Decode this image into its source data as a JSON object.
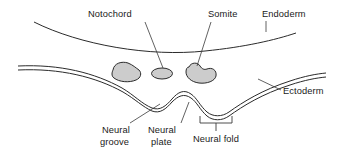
{
  "figure": {
    "background_color": "#ffffff",
    "line_color": "#2b2b2b",
    "leader_color": "#3a3a3a",
    "text_color": "#1a1a1a",
    "blob_fill_color": "#cccccc"
  },
  "labels": {
    "notochord": "Notochord",
    "somite": "Somite",
    "endoderm": "Endoderm",
    "ectoderm": "Ectoderm",
    "neural_groove_line1": "Neural",
    "neural_groove_line2": "groove",
    "neural_plate_line1": "Neural",
    "neural_plate_line2": "plate",
    "neural_fold": "Neural fold"
  },
  "structures": [
    {
      "name": "endoderm",
      "kind": "single-curve"
    },
    {
      "name": "ectoderm",
      "kind": "double-curve"
    },
    {
      "name": "notochord",
      "kind": "ellipse-blob",
      "fill": "#cccccc"
    },
    {
      "name": "somite-left",
      "kind": "bean-blob",
      "fill": "#cccccc"
    },
    {
      "name": "somite-right",
      "kind": "bean-blob",
      "fill": "#cccccc"
    },
    {
      "name": "neural-groove",
      "kind": "fold-in-ectoderm"
    },
    {
      "name": "neural-plate",
      "kind": "fold-in-ectoderm"
    },
    {
      "name": "neural-fold",
      "kind": "bracketed-region"
    }
  ]
}
